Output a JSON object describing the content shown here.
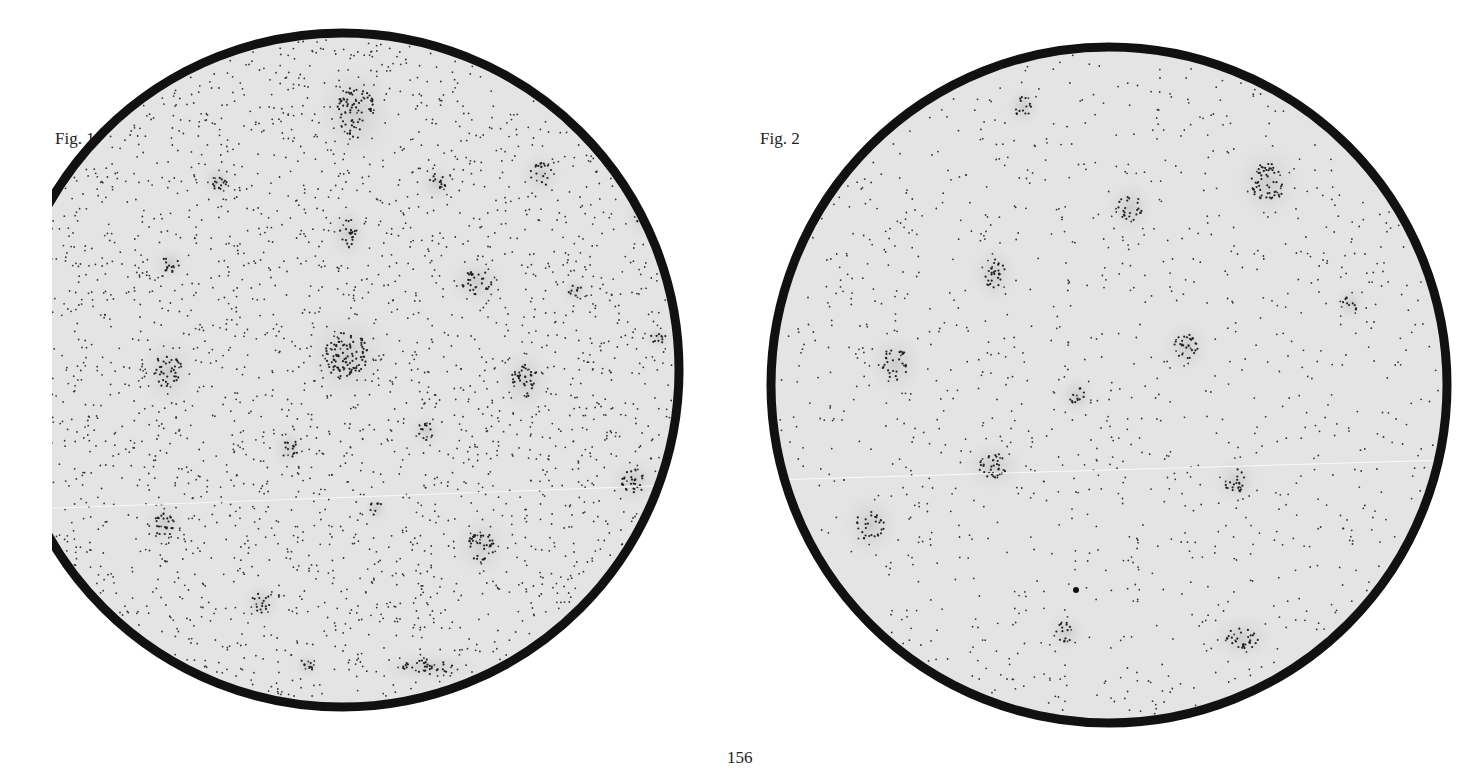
{
  "figures": [
    {
      "label": "Fig. 1",
      "circle": {
        "cx": 342,
        "cy": 370,
        "r": 337,
        "rim_width": 9
      },
      "background_dot_count": 2600,
      "seed": 11,
      "clusters": [
        {
          "x": 355,
          "y": 112,
          "rx": 20,
          "ry": 26,
          "n": 70
        },
        {
          "x": 218,
          "y": 181,
          "rx": 9,
          "ry": 9,
          "n": 14
        },
        {
          "x": 437,
          "y": 183,
          "rx": 9,
          "ry": 10,
          "n": 14
        },
        {
          "x": 541,
          "y": 174,
          "rx": 11,
          "ry": 12,
          "n": 18
        },
        {
          "x": 643,
          "y": 216,
          "rx": 10,
          "ry": 12,
          "n": 16
        },
        {
          "x": 348,
          "y": 233,
          "rx": 10,
          "ry": 14,
          "n": 22
        },
        {
          "x": 170,
          "y": 264,
          "rx": 9,
          "ry": 9,
          "n": 14
        },
        {
          "x": 477,
          "y": 282,
          "rx": 15,
          "ry": 13,
          "n": 30
        },
        {
          "x": 575,
          "y": 291,
          "rx": 7,
          "ry": 7,
          "n": 8
        },
        {
          "x": 658,
          "y": 338,
          "rx": 8,
          "ry": 6,
          "n": 10
        },
        {
          "x": 347,
          "y": 356,
          "rx": 22,
          "ry": 24,
          "n": 95
        },
        {
          "x": 168,
          "y": 371,
          "rx": 14,
          "ry": 18,
          "n": 36
        },
        {
          "x": 525,
          "y": 381,
          "rx": 14,
          "ry": 17,
          "n": 36
        },
        {
          "x": 426,
          "y": 431,
          "rx": 9,
          "ry": 9,
          "n": 12
        },
        {
          "x": 289,
          "y": 448,
          "rx": 9,
          "ry": 10,
          "n": 14
        },
        {
          "x": 634,
          "y": 481,
          "rx": 13,
          "ry": 12,
          "n": 26
        },
        {
          "x": 376,
          "y": 509,
          "rx": 7,
          "ry": 7,
          "n": 8
        },
        {
          "x": 164,
          "y": 524,
          "rx": 11,
          "ry": 12,
          "n": 24
        },
        {
          "x": 481,
          "y": 545,
          "rx": 14,
          "ry": 16,
          "n": 36
        },
        {
          "x": 261,
          "y": 603,
          "rx": 10,
          "ry": 10,
          "n": 16
        },
        {
          "x": 595,
          "y": 605,
          "rx": 6,
          "ry": 5,
          "n": 6
        },
        {
          "x": 307,
          "y": 665,
          "rx": 7,
          "ry": 7,
          "n": 8
        },
        {
          "x": 428,
          "y": 667,
          "rx": 26,
          "ry": 8,
          "n": 34
        }
      ]
    },
    {
      "label": "Fig. 2",
      "circle": {
        "cx": 1109,
        "cy": 385,
        "r": 338,
        "rim_width": 9
      },
      "background_dot_count": 1150,
      "seed": 29,
      "clusters": [
        {
          "x": 1023,
          "y": 107,
          "rx": 9,
          "ry": 10,
          "n": 14
        },
        {
          "x": 1268,
          "y": 183,
          "rx": 17,
          "ry": 20,
          "n": 55
        },
        {
          "x": 1130,
          "y": 208,
          "rx": 12,
          "ry": 14,
          "n": 24
        },
        {
          "x": 994,
          "y": 274,
          "rx": 12,
          "ry": 15,
          "n": 28
        },
        {
          "x": 1350,
          "y": 304,
          "rx": 8,
          "ry": 9,
          "n": 10
        },
        {
          "x": 1186,
          "y": 347,
          "rx": 12,
          "ry": 13,
          "n": 28
        },
        {
          "x": 895,
          "y": 364,
          "rx": 14,
          "ry": 16,
          "n": 30
        },
        {
          "x": 1077,
          "y": 396,
          "rx": 9,
          "ry": 10,
          "n": 12
        },
        {
          "x": 993,
          "y": 466,
          "rx": 16,
          "ry": 13,
          "n": 32
        },
        {
          "x": 1236,
          "y": 481,
          "rx": 12,
          "ry": 12,
          "n": 20
        },
        {
          "x": 870,
          "y": 525,
          "rx": 14,
          "ry": 17,
          "n": 30
        },
        {
          "x": 1066,
          "y": 632,
          "rx": 10,
          "ry": 10,
          "n": 14
        },
        {
          "x": 1242,
          "y": 638,
          "rx": 16,
          "ry": 12,
          "n": 30
        }
      ],
      "special_marks": [
        {
          "x": 1076,
          "y": 590,
          "r": 3,
          "type": "solid"
        },
        {
          "x": 1308,
          "y": 101,
          "r": 3,
          "type": "ring"
        }
      ]
    }
  ],
  "page_number": "156"
}
